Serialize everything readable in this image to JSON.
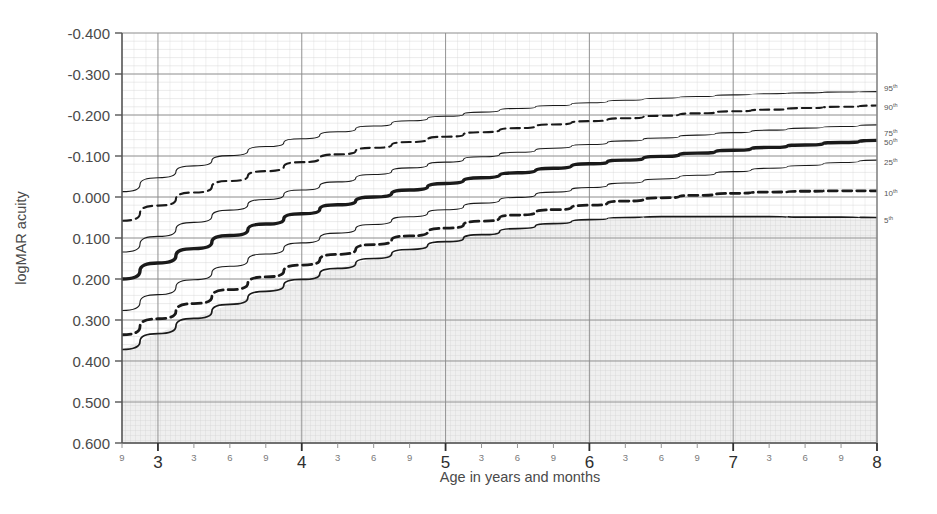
{
  "chart_data": {
    "type": "line",
    "title": "",
    "xlabel": "Age in years and months",
    "ylabel": "logMAR acuity",
    "xlim": [
      2.75,
      8.0
    ],
    "ylim": [
      -0.4,
      0.6
    ],
    "y_inverted": true,
    "grid": true,
    "legend_position": "right-of-axis",
    "y_ticks": [
      "-0.400",
      "-0.300",
      "-0.200",
      "-0.100",
      "0.000",
      "0.100",
      "0.200",
      "0.300",
      "0.400",
      "0.500",
      "0.600"
    ],
    "y_tick_values": [
      -0.4,
      -0.3,
      -0.2,
      -0.1,
      0.0,
      0.1,
      0.2,
      0.3,
      0.4,
      0.5,
      0.6
    ],
    "x_year_ticks": [
      "3",
      "4",
      "5",
      "6",
      "7",
      "8"
    ],
    "x_year_values": [
      3,
      4,
      5,
      6,
      7,
      8
    ],
    "x_month_ticks": [
      "9",
      "3",
      "6",
      "9",
      "3",
      "6",
      "9",
      "3",
      "6",
      "9",
      "3",
      "6",
      "9",
      "3",
      "6",
      "9",
      "3",
      "6",
      "9"
    ],
    "x_month_values": [
      2.75,
      3.25,
      3.5,
      3.75,
      4.25,
      4.5,
      4.75,
      5.25,
      5.5,
      5.75,
      6.25,
      6.5,
      6.75,
      7.25,
      7.5,
      7.75
    ],
    "x_unit_note": "Age in years (large ticks) and months (small ticks)",
    "shaded_region_note": "Hatched/shaded area below the 5th percentile curve",
    "series": [
      {
        "name": "95th percentile",
        "label": "95",
        "superscript": "th",
        "style": "solid-thin",
        "x": [
          2.75,
          3.0,
          3.25,
          3.5,
          3.75,
          4.0,
          4.25,
          4.5,
          4.75,
          5.0,
          5.25,
          5.5,
          5.75,
          6.0,
          6.25,
          6.5,
          6.75,
          7.0,
          7.25,
          7.5,
          7.75,
          8.0
        ],
        "values": [
          -0.013,
          -0.047,
          -0.076,
          -0.101,
          -0.123,
          -0.142,
          -0.159,
          -0.173,
          -0.186,
          -0.197,
          -0.207,
          -0.216,
          -0.223,
          -0.23,
          -0.236,
          -0.241,
          -0.245,
          -0.249,
          -0.252,
          -0.254,
          -0.256,
          -0.257
        ]
      },
      {
        "name": "90th percentile",
        "label": "90",
        "superscript": "th",
        "style": "dashed-medium",
        "x": [
          2.75,
          3.0,
          3.25,
          3.5,
          3.75,
          4.0,
          4.25,
          4.5,
          4.75,
          5.0,
          5.25,
          5.5,
          5.75,
          6.0,
          6.25,
          6.5,
          6.75,
          7.0,
          7.25,
          7.5,
          7.75,
          8.0
        ],
        "values": [
          0.058,
          0.021,
          -0.011,
          -0.039,
          -0.063,
          -0.085,
          -0.104,
          -0.12,
          -0.134,
          -0.147,
          -0.158,
          -0.168,
          -0.177,
          -0.185,
          -0.192,
          -0.198,
          -0.204,
          -0.209,
          -0.213,
          -0.217,
          -0.22,
          -0.223
        ]
      },
      {
        "name": "75th percentile",
        "label": "75",
        "superscript": "th",
        "style": "solid-thin",
        "x": [
          2.75,
          3.0,
          3.25,
          3.5,
          3.75,
          4.0,
          4.25,
          4.5,
          4.75,
          5.0,
          5.25,
          5.5,
          5.75,
          6.0,
          6.25,
          6.5,
          6.75,
          7.0,
          7.25,
          7.5,
          7.75,
          8.0
        ],
        "values": [
          0.134,
          0.096,
          0.062,
          0.032,
          0.006,
          -0.017,
          -0.037,
          -0.055,
          -0.071,
          -0.085,
          -0.098,
          -0.109,
          -0.119,
          -0.128,
          -0.137,
          -0.144,
          -0.151,
          -0.157,
          -0.163,
          -0.168,
          -0.172,
          -0.176
        ]
      },
      {
        "name": "50th percentile",
        "label": "50",
        "superscript": "th",
        "style": "solid-bold",
        "x": [
          2.75,
          3.0,
          3.25,
          3.5,
          3.75,
          4.0,
          4.25,
          4.5,
          4.75,
          5.0,
          5.25,
          5.5,
          5.75,
          6.0,
          6.25,
          6.5,
          6.75,
          7.0,
          7.25,
          7.5,
          7.75,
          8.0
        ],
        "values": [
          0.2,
          0.161,
          0.126,
          0.094,
          0.066,
          0.041,
          0.019,
          0.0,
          -0.017,
          -0.033,
          -0.047,
          -0.059,
          -0.07,
          -0.081,
          -0.09,
          -0.099,
          -0.107,
          -0.114,
          -0.121,
          -0.127,
          -0.133,
          -0.138
        ]
      },
      {
        "name": "25th percentile",
        "label": "25",
        "superscript": "th",
        "style": "solid-thin",
        "x": [
          2.75,
          3.0,
          3.25,
          3.5,
          3.75,
          4.0,
          4.25,
          4.5,
          4.75,
          5.0,
          5.25,
          5.5,
          5.75,
          6.0,
          6.25,
          6.5,
          6.75,
          7.0,
          7.25,
          7.5,
          7.75,
          8.0
        ],
        "values": [
          0.277,
          0.238,
          0.202,
          0.169,
          0.139,
          0.112,
          0.088,
          0.067,
          0.048,
          0.031,
          0.015,
          0.001,
          -0.012,
          -0.023,
          -0.034,
          -0.044,
          -0.053,
          -0.062,
          -0.07,
          -0.077,
          -0.084,
          -0.09
        ]
      },
      {
        "name": "10th percentile",
        "label": "10",
        "superscript": "th",
        "style": "dashed-bold",
        "x": [
          2.75,
          3.0,
          3.25,
          3.5,
          3.75,
          4.0,
          4.25,
          4.5,
          4.75,
          5.0,
          5.25,
          5.5,
          5.75,
          6.0,
          6.25,
          6.5,
          6.75,
          7.0,
          7.25,
          7.5,
          7.75,
          8.0
        ],
        "values": [
          0.336,
          0.297,
          0.26,
          0.226,
          0.195,
          0.166,
          0.14,
          0.116,
          0.095,
          0.076,
          0.059,
          0.044,
          0.031,
          0.02,
          0.01,
          0.002,
          -0.004,
          -0.009,
          -0.012,
          -0.014,
          -0.015,
          -0.015
        ]
      },
      {
        "name": "5th percentile",
        "label": "5",
        "superscript": "th",
        "style": "solid-medium",
        "x": [
          2.75,
          3.0,
          3.25,
          3.5,
          3.75,
          4.0,
          4.25,
          4.5,
          4.75,
          5.0,
          5.25,
          5.5,
          5.75,
          6.0,
          6.25,
          6.5,
          6.75,
          7.0,
          7.25,
          7.5,
          7.75,
          8.0
        ],
        "values": [
          0.372,
          0.333,
          0.296,
          0.262,
          0.23,
          0.201,
          0.174,
          0.15,
          0.128,
          0.109,
          0.092,
          0.077,
          0.065,
          0.055,
          0.05,
          0.048,
          0.048,
          0.048,
          0.048,
          0.049,
          0.049,
          0.05
        ]
      }
    ]
  },
  "colors": {
    "axis": "#555555",
    "grid_major": "#8a8a8a",
    "grid_minor": "#d8d8d8",
    "curve": "#1a1a1a",
    "shade_fill": "#ebebeb",
    "text": "#4a4a4a"
  }
}
